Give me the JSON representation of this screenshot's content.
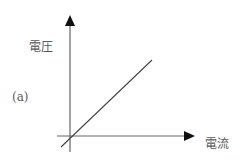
{
  "figure": {
    "panel_label": "(a)",
    "y_axis_label": "電圧",
    "x_axis_label": "電流",
    "line": {
      "description": "linear proportional relation through origin",
      "color": "#444444"
    },
    "axis_color": "#555555"
  }
}
